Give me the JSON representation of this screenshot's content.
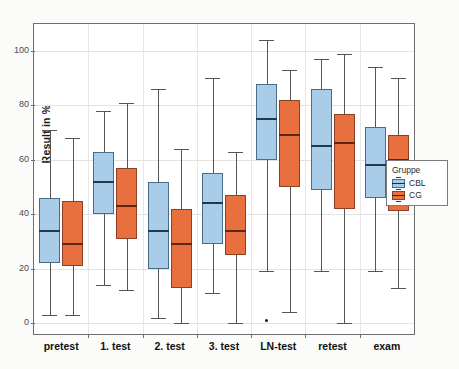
{
  "chart_data": {
    "type": "box",
    "title": "",
    "xlabel": "",
    "ylabel": "Result in %",
    "ylim": [
      -6,
      108
    ],
    "yticks": [
      0,
      20,
      40,
      60,
      80,
      100
    ],
    "ytick_labels": [
      "0",
      "20",
      "40",
      "60",
      "80",
      "100"
    ],
    "grid": true,
    "categories": [
      "pretest",
      "1. test",
      "2. test",
      "3. test",
      "LN-test",
      "retest",
      "exam"
    ],
    "legend": {
      "title": "Gruppe",
      "position": "right",
      "entries": [
        {
          "name": "CBL",
          "color": "#a9cde8"
        },
        {
          "name": "CG",
          "color": "#e8703f"
        }
      ]
    },
    "series": [
      {
        "name": "CBL",
        "color": "#a9cde8",
        "boxes": [
          {
            "category": "pretest",
            "whisker_low": 3,
            "q1": 22,
            "median": 34,
            "q3": 46,
            "whisker_high": 71,
            "outliers": []
          },
          {
            "category": "1. test",
            "whisker_low": 14,
            "q1": 40,
            "median": 52,
            "q3": 63,
            "whisker_high": 78,
            "outliers": []
          },
          {
            "category": "2. test",
            "whisker_low": 2,
            "q1": 20,
            "median": 34,
            "q3": 52,
            "whisker_high": 86,
            "outliers": []
          },
          {
            "category": "3. test",
            "whisker_low": 11,
            "q1": 29,
            "median": 44,
            "q3": 55,
            "whisker_high": 90,
            "outliers": []
          },
          {
            "category": "LN-test",
            "whisker_low": 19,
            "q1": 60,
            "median": 75,
            "q3": 88,
            "whisker_high": 104,
            "outliers": [
              1
            ]
          },
          {
            "category": "retest",
            "whisker_low": 19,
            "q1": 49,
            "median": 65,
            "q3": 86,
            "whisker_high": 97,
            "outliers": []
          },
          {
            "category": "exam",
            "whisker_low": 19,
            "q1": 46,
            "median": 58,
            "q3": 72,
            "whisker_high": 94,
            "outliers": []
          }
        ]
      },
      {
        "name": "CG",
        "color": "#e8703f",
        "boxes": [
          {
            "category": "pretest",
            "whisker_low": 3,
            "q1": 21,
            "median": 29,
            "q3": 45,
            "whisker_high": 68,
            "outliers": []
          },
          {
            "category": "1. test",
            "whisker_low": 12,
            "q1": 31,
            "median": 43,
            "q3": 57,
            "whisker_high": 81,
            "outliers": []
          },
          {
            "category": "2. test",
            "whisker_low": 0,
            "q1": 13,
            "median": 29,
            "q3": 42,
            "whisker_high": 64,
            "outliers": []
          },
          {
            "category": "3. test",
            "whisker_low": 0,
            "q1": 25,
            "median": 34,
            "q3": 47,
            "whisker_high": 63,
            "outliers": []
          },
          {
            "category": "LN-test",
            "whisker_low": 4,
            "q1": 50,
            "median": 69,
            "q3": 82,
            "whisker_high": 93,
            "outliers": []
          },
          {
            "category": "retest",
            "whisker_low": 0,
            "q1": 42,
            "median": 66,
            "q3": 77,
            "whisker_high": 99,
            "outliers": []
          },
          {
            "category": "exam",
            "whisker_low": 13,
            "q1": 41,
            "median": 60,
            "q3": 69,
            "whisker_high": 90,
            "outliers": []
          }
        ]
      }
    ]
  }
}
